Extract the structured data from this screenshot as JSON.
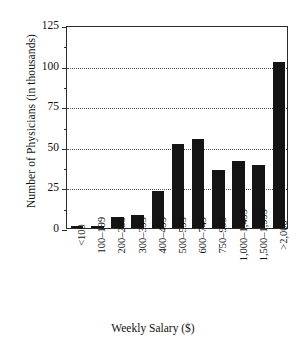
{
  "chart_data": {
    "type": "bar",
    "title": "",
    "xlabel": "Weekly Salary ($)",
    "ylabel": "Number of Physicians (in thousands)",
    "categories": [
      "<100",
      "100–199",
      "200–299",
      "300–399",
      "400–499",
      "500–599",
      "600–749",
      "750–999",
      "1,000–1,499",
      "1,500–1,999",
      ">2,000"
    ],
    "values": [
      1,
      1.5,
      7,
      8,
      23,
      52,
      55,
      36,
      41,
      39,
      102
    ],
    "ylim": [
      0,
      125
    ],
    "yticks": [
      0,
      25,
      50,
      75,
      100,
      125
    ],
    "ytick_labels": [
      "0",
      "25",
      "50",
      "75",
      "100",
      "125"
    ],
    "y_minor_ticks": [
      12.5,
      37.5,
      62.5,
      87.5,
      112.5
    ],
    "grid": "horizontal-dotted",
    "gridlines_at": [
      25,
      50,
      75,
      100
    ],
    "legend": "none",
    "bar_color": "#141414",
    "axis_color": "#2b2b2b",
    "background": "#ffffff"
  }
}
